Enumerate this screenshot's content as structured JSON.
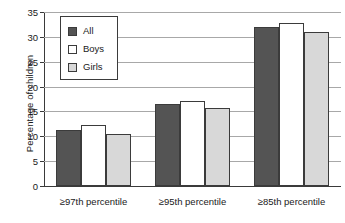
{
  "chart_data": {
    "type": "bar",
    "title": "",
    "subtitle": "",
    "xlabel": "",
    "ylabel": "Percentage of children",
    "ylim": [
      0,
      35
    ],
    "ytick_step": 5,
    "yticks": [
      "0",
      "5",
      "10",
      "15",
      "20",
      "25",
      "30",
      "35"
    ],
    "grid": true,
    "legend_position": "upper-left-inside",
    "categories": [
      "≥97th percentile",
      "≥95th percentile",
      "≥85th percentile"
    ],
    "series": [
      {
        "name": "All",
        "color": "#545454",
        "values": [
          11.3,
          16.4,
          31.9
        ]
      },
      {
        "name": "Boys",
        "color": "#ffffff",
        "values": [
          12.2,
          17.1,
          32.8
        ]
      },
      {
        "name": "Girls",
        "color": "#d8d8d8",
        "values": [
          10.5,
          15.6,
          30.9
        ]
      }
    ]
  },
  "legend": {
    "items": [
      {
        "label": "All"
      },
      {
        "label": "Boys"
      },
      {
        "label": "Girls"
      }
    ]
  }
}
